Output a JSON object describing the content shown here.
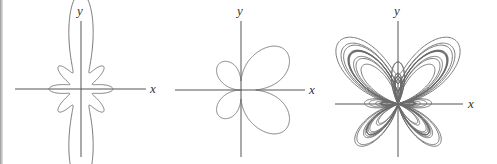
{
  "figure": {
    "panels": [
      {
        "id": "panel-1",
        "origin": [
          81,
          89
        ],
        "x_axis": [
          15,
          146
        ],
        "y_axis": [
          21,
          157
        ],
        "x_label": "x",
        "y_label": "y",
        "x_label_pos": [
          150,
          93
        ],
        "y_label_pos": [
          77,
          15
        ],
        "curve": "r = 1 + 0.3*cos(8θ) ... vertical elongated petals with 8 small lobes",
        "curve_id": "flower",
        "scale": 22
      },
      {
        "id": "panel-2",
        "origin": [
          241,
          90
        ],
        "x_axis": [
          175,
          305
        ],
        "y_axis": [
          21,
          157
        ],
        "x_label": "x",
        "y_label": "y",
        "x_label_pos": [
          309,
          94
        ],
        "y_label_pos": [
          237,
          15
        ],
        "curve_id": "four-petal",
        "scale": 64
      },
      {
        "id": "panel-3",
        "origin": [
          398,
          104
        ],
        "x_axis": [
          335,
          463
        ],
        "y_axis": [
          21,
          157
        ],
        "x_label": "x",
        "y_label": "y",
        "x_label_pos": [
          468,
          108
        ],
        "y_label_pos": [
          394,
          15
        ],
        "curve": "r = e^{sin θ} − 2cos(4θ) + sin^5((2θ−π)/24)",
        "curve_id": "butterfly",
        "scale": 17
      }
    ]
  }
}
